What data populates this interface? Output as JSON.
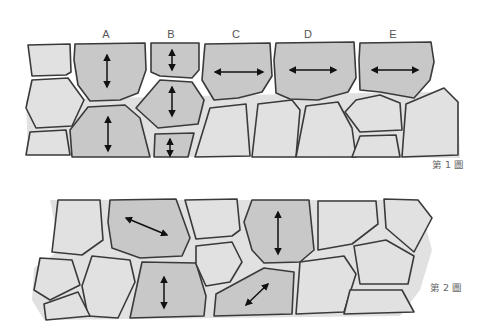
{
  "figure1": {
    "caption": "第 1 圖",
    "column_labels": [
      "A",
      "B",
      "C",
      "D",
      "E"
    ],
    "arrows": [
      {
        "column": "A",
        "cell": "upper",
        "direction": "vertical"
      },
      {
        "column": "A",
        "cell": "lower",
        "direction": "vertical"
      },
      {
        "column": "B",
        "cell": "top",
        "direction": "vertical"
      },
      {
        "column": "B",
        "cell": "middle",
        "direction": "vertical"
      },
      {
        "column": "B",
        "cell": "bottom",
        "direction": "vertical"
      },
      {
        "column": "C",
        "cell": "top",
        "direction": "horizontal"
      },
      {
        "column": "D",
        "cell": "top",
        "direction": "horizontal"
      },
      {
        "column": "E",
        "cell": "top",
        "direction": "horizontal"
      }
    ]
  },
  "figure2": {
    "caption": "第 2 圖",
    "arrows": [
      {
        "cell": "top-left-dark",
        "direction": "diagonal-down-right"
      },
      {
        "cell": "top-right-dark",
        "direction": "vertical"
      },
      {
        "cell": "bottom-left-dark",
        "direction": "vertical"
      },
      {
        "cell": "bottom-right-dark",
        "direction": "diagonal-up-right"
      }
    ]
  },
  "colors": {
    "dark_cell": "#c8c8c8",
    "light_cell": "#e1e1e1",
    "outline": "#3a3a3a",
    "arrow": "#111111"
  }
}
